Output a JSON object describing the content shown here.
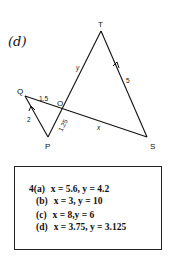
{
  "figure": {
    "part_label": "(d)",
    "vertices": {
      "T": "T",
      "Q": "Q",
      "O": "O",
      "P": "P",
      "S": "S"
    },
    "edge_labels": {
      "TO": "y",
      "TS": "5",
      "QO": "1.5",
      "QP": "2",
      "OP": "1.25",
      "OS": "x"
    }
  },
  "answers": {
    "rows": [
      {
        "key": "4(a)",
        "value": "x = 5.6, y = 4.2"
      },
      {
        "key": "(b)",
        "value": "x = 3, y = 10"
      },
      {
        "key": "(c)",
        "value": "x = 8,y = 6"
      },
      {
        "key": "(d)",
        "value": "x = 3.75, y = 3.125"
      }
    ]
  }
}
